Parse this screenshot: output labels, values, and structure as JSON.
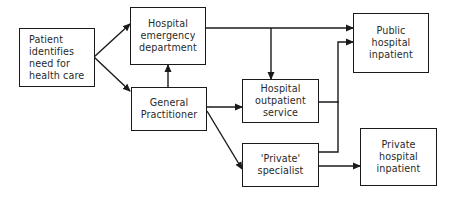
{
  "diagram": {
    "type": "flowchart",
    "title": "",
    "nodes": [
      {
        "id": "patient",
        "label": "Patient\nidentifies\nneed for\nhealth care"
      },
      {
        "id": "emergency",
        "label": "Hospital\nemergency\ndepartment"
      },
      {
        "id": "gp",
        "label": "General\nPractitioner"
      },
      {
        "id": "outpatient",
        "label": "Hospital\noutpatient\nservice"
      },
      {
        "id": "specialist",
        "label": "'Private'\nspecialist"
      },
      {
        "id": "public_inpatient",
        "label": "Public\nhospital\ninpatient"
      },
      {
        "id": "private_inpatient",
        "label": "Private\nhospital\ninpatient"
      }
    ],
    "edges": [
      {
        "from": "patient",
        "to": "emergency"
      },
      {
        "from": "patient",
        "to": "gp"
      },
      {
        "from": "gp",
        "to": "emergency"
      },
      {
        "from": "emergency",
        "to": "public_inpatient"
      },
      {
        "from": "emergency",
        "to": "outpatient"
      },
      {
        "from": "gp",
        "to": "outpatient"
      },
      {
        "from": "gp",
        "to": "specialist"
      },
      {
        "from": "outpatient",
        "to": "public_inpatient"
      },
      {
        "from": "specialist",
        "to": "public_inpatient"
      },
      {
        "from": "specialist",
        "to": "private_inpatient"
      }
    ],
    "colors": {
      "line": "#1a1a1a",
      "text": "#2a2a2a",
      "background": "#ffffff"
    }
  }
}
